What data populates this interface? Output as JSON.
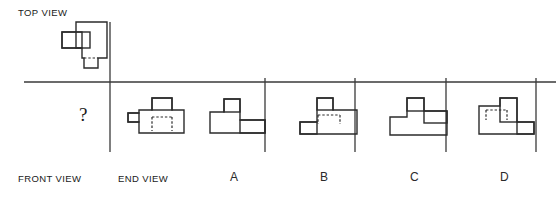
{
  "figure": {
    "type": "orthographic-projection-puzzle",
    "labels": {
      "top_view": "TOP VIEW",
      "front_view": "FRONT VIEW",
      "end_view": "END VIEW",
      "missing_marker": "?"
    },
    "options": [
      {
        "id": "A",
        "label": "A"
      },
      {
        "id": "B",
        "label": "B"
      },
      {
        "id": "C",
        "label": "C"
      },
      {
        "id": "D",
        "label": "D"
      }
    ],
    "colors": {
      "ink": "#2b2b2b",
      "axis": "#3a3a3a",
      "background": "#ffffff"
    }
  },
  "drawings": {
    "top_view": {
      "name": "top-view-shape",
      "outline": "M 62,32 L 62,48 L 82,48 L 82,58 L 84,58 L 84,68 L 98,68 L 98,58 L 107,58 L 107,22 L 76,22 L 76,32 Z",
      "inner_rects": [
        {
          "x": 76,
          "y": 32,
          "w": 14,
          "h": 16
        }
      ],
      "hidden_edges": [
        "M 84,58 L 98,58"
      ]
    },
    "end_view": {
      "name": "end-view-shape",
      "outline": "M 128,113 L 128,122 L 139,122 L 139,133 L 184,133 L 184,110 L 172,110 L 172,98 L 152,98 L 152,110 L 139,110 L 139,113 Z",
      "inner_rects": [
        {
          "x": 152,
          "y": 98,
          "w": 20,
          "h": 12
        },
        {
          "x": 128,
          "y": 113,
          "w": 11,
          "h": 9
        }
      ],
      "hidden_edges": [
        "M 152,117 L 152,131 M 152,117 L 172,117 M 172,117 L 172,131"
      ]
    },
    "option_a": {
      "name": "option-a-shape",
      "outline": "M 210,112 L 210,133 L 265,133 L 265,120 L 240,120 L 240,99 L 224,99 L 224,112 Z",
      "inner_rects": [
        {
          "x": 224,
          "y": 99,
          "w": 16,
          "h": 13
        },
        {
          "x": 240,
          "y": 120,
          "w": 25,
          "h": 13
        }
      ],
      "hidden_edges": []
    },
    "option_b": {
      "name": "option-b-shape",
      "outline": "M 300,122 L 300,134 L 357,134 L 357,110 L 333,110 L 333,98 L 317,98 L 317,122 Z",
      "inner_rects": [
        {
          "x": 317,
          "y": 98,
          "w": 16,
          "h": 12
        },
        {
          "x": 300,
          "y": 122,
          "w": 17,
          "h": 12
        }
      ],
      "hidden_edges": [
        "M 318,115 L 318,124 M 318,115 L 340,115 M 340,115 L 340,124"
      ]
    },
    "option_c": {
      "name": "option-c-shape",
      "outline": "M 390,117 L 390,135 L 447,135 L 447,111 L 424,111 L 424,98 L 407,98 L 407,117 Z",
      "inner_rects": [
        {
          "x": 407,
          "y": 98,
          "w": 17,
          "h": 13
        },
        {
          "x": 424,
          "y": 111,
          "w": 23,
          "h": 12
        }
      ],
      "hidden_edges": []
    },
    "option_d": {
      "name": "option-d-shape",
      "outline": "M 479,106 L 479,134 L 534,134 L 534,122 L 517,122 L 517,98 L 500,98 L 500,106 Z",
      "inner_rects": [
        {
          "x": 500,
          "y": 98,
          "w": 17,
          "h": 24
        },
        {
          "x": 517,
          "y": 122,
          "w": 17,
          "h": 12
        }
      ],
      "hidden_edges": [
        "M 486,110 L 486,120 M 486,110 L 507,110 M 507,110 L 507,120"
      ]
    }
  },
  "axes": {
    "main": {
      "name": "main-crosshair",
      "v_x": 110,
      "v_y1": 22,
      "v_y2": 152,
      "h_y": 82,
      "h_x1": 24,
      "h_x2": 196
    },
    "a": {
      "name": "option-a-crosshair",
      "v_x": 265,
      "v_y1": 78,
      "v_y2": 152,
      "h_y": 82,
      "h_x1": 196,
      "h_x2": 286
    },
    "b": {
      "name": "option-b-crosshair",
      "v_x": 355,
      "v_y1": 78,
      "v_y2": 152,
      "h_y": 82,
      "h_x1": 286,
      "h_x2": 376
    },
    "c": {
      "name": "option-c-crosshair",
      "v_x": 446,
      "v_y1": 78,
      "v_y2": 152,
      "h_y": 82,
      "h_x1": 376,
      "h_x2": 466
    },
    "d": {
      "name": "option-d-crosshair",
      "v_x": 536,
      "v_y1": 78,
      "v_y2": 152,
      "h_y": 82,
      "h_x1": 466,
      "h_x2": 556
    }
  }
}
